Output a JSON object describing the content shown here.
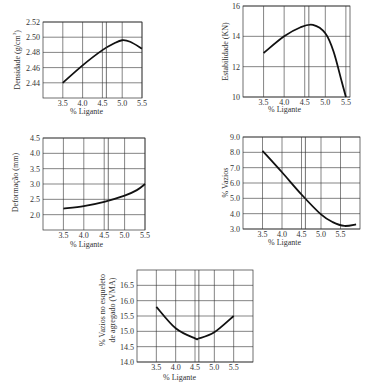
{
  "chart_data": [
    {
      "id": "densidade",
      "type": "line",
      "title": "",
      "xlabel": "% Ligante",
      "ylabel": "Densidade (g/cm³)",
      "xlim": [
        3.0,
        5.5
      ],
      "ylim": [
        2.42,
        2.52
      ],
      "x_ticks": [
        "3.5",
        "4.0",
        "4.5",
        "5.0",
        "5.5"
      ],
      "y_ticks": [
        "2.44",
        "2.46",
        "2.48",
        "2.50",
        "2.52"
      ],
      "grid": true,
      "marker_x": 4.6,
      "x": [
        3.5,
        4.0,
        4.5,
        4.8,
        5.0,
        5.2,
        5.5
      ],
      "y": [
        2.44,
        2.463,
        2.483,
        2.492,
        2.496,
        2.494,
        2.485
      ]
    },
    {
      "id": "estabilidade",
      "type": "line",
      "title": "",
      "xlabel": "% Ligante",
      "ylabel": "Estabilidade (KN)",
      "xlim": [
        3.0,
        5.6
      ],
      "ylim": [
        10,
        16
      ],
      "x_ticks": [
        "3.5",
        "4.0",
        "4.5",
        "5.0",
        "5.5"
      ],
      "y_ticks": [
        "10",
        "12",
        "14",
        "16"
      ],
      "grid": true,
      "marker_x": 4.6,
      "x": [
        3.5,
        4.0,
        4.4,
        4.7,
        5.0,
        5.2,
        5.4,
        5.5
      ],
      "y": [
        12.9,
        14.0,
        14.6,
        14.75,
        14.2,
        13.0,
        11.0,
        10.0
      ]
    },
    {
      "id": "deformacao",
      "type": "line",
      "title": "",
      "xlabel": "% Ligante",
      "ylabel": "Deformação (mm)",
      "xlim": [
        3.0,
        5.5
      ],
      "ylim": [
        1.5,
        4.5
      ],
      "x_ticks": [
        "3.5",
        "4.0",
        "4.5",
        "5.0",
        "5.5"
      ],
      "y_ticks": [
        "2.0",
        "2.5",
        "3.0",
        "3.5",
        "4.0",
        "4.5"
      ],
      "grid": true,
      "marker_x": 4.6,
      "x": [
        3.5,
        4.0,
        4.5,
        5.0,
        5.3,
        5.5
      ],
      "y": [
        2.2,
        2.28,
        2.42,
        2.62,
        2.8,
        3.0
      ]
    },
    {
      "id": "vazios",
      "type": "line",
      "title": "",
      "xlabel": "% Ligante",
      "ylabel": "% Vazios",
      "xlim": [
        3.0,
        6.0
      ],
      "ylim": [
        3.0,
        9.0
      ],
      "x_ticks": [
        "3.5",
        "4.0",
        "4.5",
        "5.0",
        "5.5"
      ],
      "y_ticks": [
        "3.0",
        "4.0",
        "5.0",
        "6.0",
        "7.0",
        "8.0",
        "9.0"
      ],
      "grid": true,
      "marker_x": 4.6,
      "x": [
        3.5,
        4.0,
        4.5,
        5.0,
        5.3,
        5.6,
        5.9
      ],
      "y": [
        8.1,
        6.7,
        5.25,
        3.95,
        3.45,
        3.2,
        3.3
      ]
    },
    {
      "id": "vma",
      "type": "line",
      "title": "",
      "xlabel": "% Ligante",
      "ylabel": "% Vazios no esqueleto de agregado (VMA)",
      "xlim": [
        3.0,
        6.0
      ],
      "ylim": [
        14.0,
        17.0
      ],
      "x_ticks": [
        "3.5",
        "4.0",
        "4.5",
        "5.0",
        "5.5"
      ],
      "y_ticks": [
        "14.0",
        "14.5",
        "15.0",
        "15.5",
        "16.0",
        "16.5"
      ],
      "grid": true,
      "marker_x": 4.6,
      "x": [
        3.5,
        4.0,
        4.5,
        4.6,
        5.0,
        5.5
      ],
      "y": [
        15.8,
        15.1,
        14.77,
        14.77,
        14.97,
        15.5
      ]
    }
  ],
  "labels": {
    "x_axis": "% Ligante",
    "densidade_y": "Densidade (g/cm",
    "densidade_sup": "3",
    "densidade_close": ")",
    "estabilidade_y": "Estabilidade (KN)",
    "deformacao_y": "Deformação (mm)",
    "vazios_y": "% Vazios",
    "vma_y_line1": "% Vazios no esqueleto",
    "vma_y_line2": "de agregado (VMA)"
  }
}
